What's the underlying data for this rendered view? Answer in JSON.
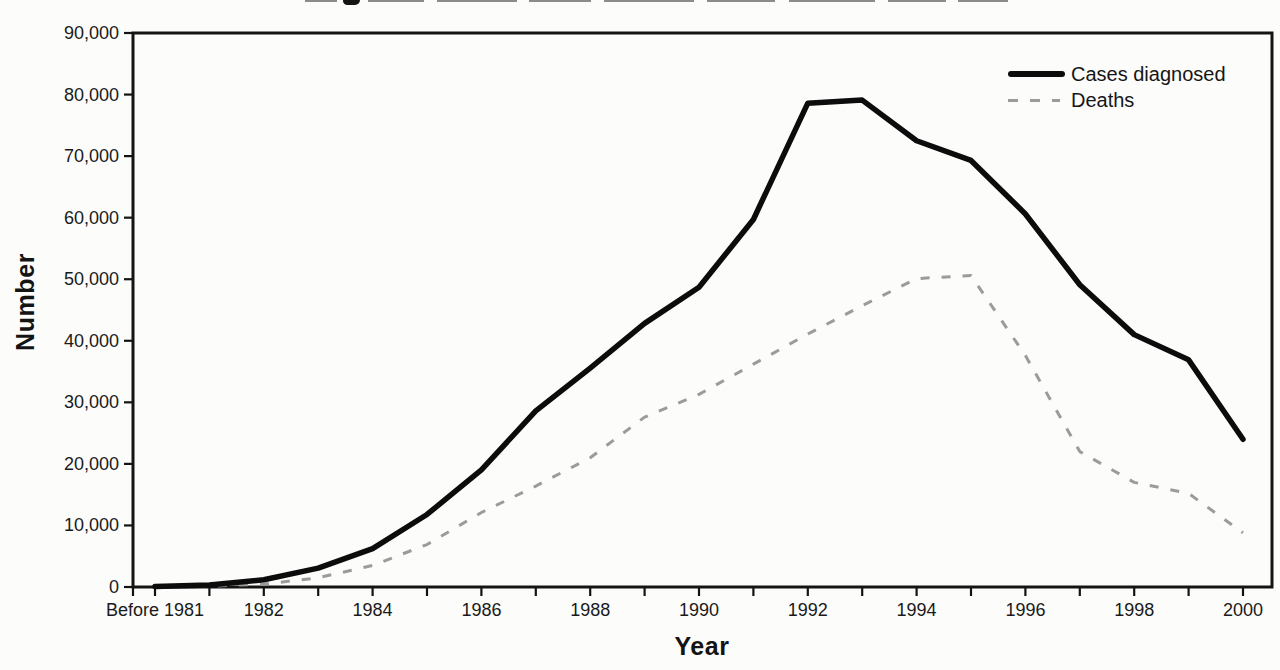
{
  "chart_data": {
    "type": "line",
    "xlabel": "Year",
    "ylabel": "Number",
    "ylim": [
      0,
      90000
    ],
    "y_tick_step": 10000,
    "x_label_every": 2,
    "grid": false,
    "legend_position": "top-right",
    "categories": [
      "Before 1981",
      "1981",
      "1982",
      "1983",
      "1984",
      "1985",
      "1986",
      "1987",
      "1988",
      "1989",
      "1990",
      "1991",
      "1992",
      "1993",
      "1994",
      "1995",
      "1996",
      "1997",
      "1998",
      "1999",
      "2000"
    ],
    "series": [
      {
        "name": "Cases diagnosed",
        "style": "solid",
        "color": "#0c0c0c",
        "values": [
          100,
          320,
          1170,
          3060,
          6240,
          11780,
          19040,
          28600,
          35560,
          42830,
          48700,
          59700,
          78600,
          79100,
          72500,
          69300,
          60600,
          49100,
          41000,
          36900,
          24000
        ]
      },
      {
        "name": "Deaths",
        "style": "dashed",
        "color": "#9b9b9b",
        "values": [
          30,
          130,
          460,
          1500,
          3500,
          6900,
          12100,
          16400,
          21000,
          27600,
          31300,
          36200,
          41100,
          45700,
          50100,
          50600,
          37600,
          22000,
          17000,
          15200,
          8800
        ]
      }
    ]
  }
}
